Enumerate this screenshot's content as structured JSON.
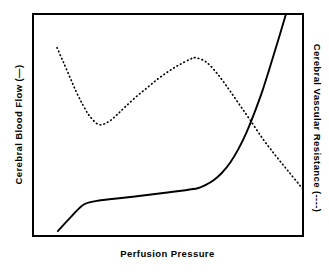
{
  "figure": {
    "background_color": "#ffffff",
    "frame_color": "#000000"
  },
  "axes": {
    "y_left": {
      "label": "Cerebral Blood Flow (—)",
      "name": "Cerebral Blood Flow",
      "series_marker": "solid line"
    },
    "y_right": {
      "label": "Cerebral Vascular Resistance  (----)",
      "name": "Cerebral Vascular Resistance",
      "series_marker": "dotted line"
    },
    "x": {
      "label": "Perfusion Pressure",
      "name": "Perfusion Pressure"
    }
  },
  "chart_data": {
    "type": "line",
    "title": "",
    "subtitle": "",
    "xlabel": "Perfusion Pressure",
    "ylabel": "Cerebral Blood Flow (—)",
    "y2label": "Cerebral Vascular Resistance (----)",
    "grid": false,
    "legend": "inline in axis labels",
    "xlim": [
      0,
      100
    ],
    "ylim": [
      0,
      100
    ],
    "y2lim": [
      0,
      100
    ],
    "xticks": [],
    "yticks": [],
    "series": [
      {
        "name": "Cerebral Blood Flow",
        "style": "solid",
        "color": "#000000",
        "axis": "left",
        "x": [
          9.2,
          14.0,
          19.0,
          25.1,
          31.0,
          37.0,
          43.0,
          49.0,
          55.0,
          61.0,
          64.0,
          67.0,
          70.0,
          73.0,
          76.0,
          79.0,
          82.0,
          85.0,
          88.0,
          91.0,
          93.7
        ],
        "y": [
          2.2,
          8.5,
          14.3,
          16.1,
          16.9,
          17.7,
          18.6,
          19.5,
          20.4,
          21.5,
          23.0,
          25.2,
          28.5,
          33.0,
          39.0,
          46.5,
          55.5,
          65.5,
          77.0,
          89.0,
          100.0
        ]
      },
      {
        "name": "Cerebral Vascular Resistance",
        "style": "dotted",
        "color": "#000000",
        "axis": "right",
        "x": [
          8.9,
          11.0,
          13.5,
          16.0,
          18.5,
          21.0,
          24.4,
          28.0,
          31.0,
          34.0,
          38.0,
          42.0,
          46.0,
          50.0,
          54.0,
          58.0,
          60.1,
          64.0,
          68.0,
          72.0,
          76.0,
          80.0,
          85.0,
          90.0,
          95.0,
          100.0
        ],
        "y": [
          84.8,
          79.0,
          72.0,
          65.0,
          59.0,
          54.0,
          50.2,
          51.5,
          54.5,
          58.0,
          62.5,
          66.5,
          70.5,
          74.0,
          77.0,
          79.5,
          80.3,
          78.5,
          73.5,
          67.0,
          60.0,
          53.0,
          44.0,
          36.0,
          28.5,
          21.1
        ]
      }
    ]
  }
}
